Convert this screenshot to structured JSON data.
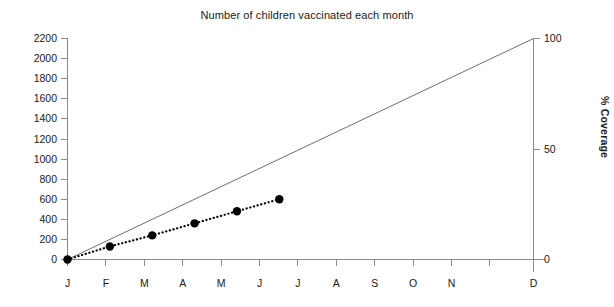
{
  "chart_data": {
    "type": "line",
    "title": "Number of children vaccinated each month",
    "xlabel": "",
    "ylabel": "",
    "categories": [
      "J",
      "F",
      "M",
      "A",
      "M",
      "J",
      "J",
      "A",
      "S",
      "O",
      "N",
      "D"
    ],
    "x_tick_labels": [
      "J",
      "F",
      "M",
      "A",
      "M",
      "J",
      "J",
      "A",
      "S",
      "O",
      "N",
      "D"
    ],
    "ylim": [
      0,
      2200
    ],
    "y_tick_labels": [
      "0",
      "200",
      "400",
      "600",
      "800",
      "1000",
      "1200",
      "1400",
      "1600",
      "1800",
      "2000",
      "2200"
    ],
    "y_ticks": [
      0,
      200,
      400,
      600,
      800,
      1000,
      1200,
      1400,
      1600,
      1800,
      2000,
      2200
    ],
    "secondary_axis": {
      "label": "% Coverage",
      "ylim": [
        0,
        100
      ],
      "ticks": [
        0,
        50,
        100
      ],
      "tick_labels": [
        "0",
        "50",
        "100"
      ]
    },
    "grid": false,
    "legend": "none",
    "series": [
      {
        "name": "target-line",
        "style": "solid-thin",
        "color": "#6e6e6e",
        "x": [
          "J",
          "D"
        ],
        "values": [
          0,
          2200
        ],
        "percent_values": [
          0,
          100
        ]
      },
      {
        "name": "children-vaccinated",
        "style": "dotted-with-markers",
        "color": "#000000",
        "x": [
          "J",
          "F",
          "M",
          "A",
          "M",
          "J"
        ],
        "values": [
          0,
          130,
          240,
          360,
          480,
          600
        ],
        "percent_values": [
          0,
          5.9,
          10.9,
          16.4,
          21.8,
          27.3
        ]
      }
    ]
  },
  "axes": {
    "left_title": "",
    "right_title": "% Coverage"
  }
}
